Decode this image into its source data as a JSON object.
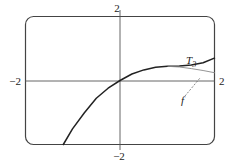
{
  "chart_data": {
    "type": "line",
    "title": "",
    "xlabel": "",
    "ylabel": "",
    "xlim": [
      -2,
      2
    ],
    "ylim": [
      -2,
      2
    ],
    "grid": false,
    "tick_labels": {
      "x_left": "−2",
      "x_right": "2",
      "y_top": "2",
      "y_bottom": "−2"
    },
    "series": [
      {
        "name": "T3",
        "label": "T",
        "subscript": "3",
        "x": [
          -1.2,
          -1.0,
          -0.75,
          -0.5,
          -0.25,
          0,
          0.25,
          0.5,
          0.75,
          1.0,
          1.25,
          1.5,
          1.75,
          2.0
        ],
        "y": [
          -2.0,
          -1.5,
          -1.0,
          -0.55,
          -0.24,
          0,
          0.2,
          0.33,
          0.41,
          0.44,
          0.45,
          0.48,
          0.55,
          0.7
        ]
      },
      {
        "name": "f",
        "label": "f",
        "x": [
          1.0,
          1.25,
          1.5,
          1.75,
          2.0
        ],
        "y": [
          0.44,
          0.42,
          0.37,
          0.31,
          0.24
        ]
      }
    ],
    "annotations": [
      {
        "text": "T3",
        "x": 1.45,
        "y": 0.72
      },
      {
        "text": "f",
        "x": 1.38,
        "y": -0.5,
        "arrow_to": [
          1.6,
          0.33
        ]
      }
    ]
  }
}
